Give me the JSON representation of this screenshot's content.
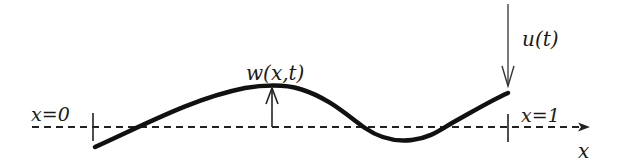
{
  "diagram": {
    "title": "",
    "labels": {
      "left_boundary": "x=0",
      "right_boundary": "x=1",
      "deflection": "w(x,t)",
      "input": "u(t)",
      "axis": "x"
    },
    "elements": {
      "axis": {
        "style": "dashed",
        "direction": "right",
        "has_arrowhead": true
      },
      "beam_curve": {
        "style": "solid-thick",
        "description": "deflected beam shape between x=0 and x=1"
      },
      "deflection_arrow": {
        "direction": "up",
        "from": "axis",
        "to": "beam_curve"
      },
      "input_arrow": {
        "direction": "down",
        "target": "beam right end (x=1)"
      },
      "left_tick": {
        "position": "x=0"
      },
      "right_tick": {
        "position": "x=1"
      }
    },
    "colors": {
      "line": "#111111",
      "background": "#ffffff"
    }
  }
}
